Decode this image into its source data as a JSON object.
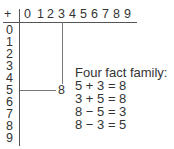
{
  "table": {
    "corner": "+",
    "columns": [
      "0",
      "1",
      "2",
      "3",
      "4",
      "5",
      "6",
      "7",
      "8",
      "9"
    ],
    "rows": [
      "0",
      "1",
      "2",
      "3",
      "4",
      "5",
      "6",
      "7",
      "8",
      "9"
    ],
    "highlight": {
      "row": "5",
      "column": "3",
      "result": "8"
    }
  },
  "facts": {
    "title": "Four fact family:",
    "items": [
      "5 + 3 = 8",
      "3 + 5 = 8",
      "8 − 5 = 3",
      "8 − 3 = 5"
    ]
  }
}
